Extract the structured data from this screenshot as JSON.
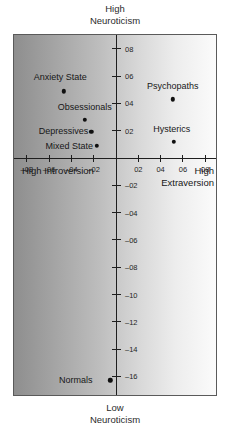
{
  "chart_data": {
    "type": "scatter",
    "title": "",
    "top_caption": [
      "High",
      "Neuroticism"
    ],
    "bottom_caption": [
      "Low",
      "Neuroticism"
    ],
    "xlabel": "",
    "ylabel": "",
    "xlim": [
      -10,
      10
    ],
    "ylim": [
      -18,
      10
    ],
    "grid": false,
    "legend": "none",
    "axis_quadrant_labels": {
      "left": [
        "High",
        "Introversion"
      ],
      "right": [
        "High",
        "Extraversion"
      ]
    },
    "xticks": [
      {
        "value": -8,
        "label": "–08"
      },
      {
        "value": -6,
        "label": "–06"
      },
      {
        "value": -4,
        "label": "–04"
      },
      {
        "value": -2,
        "label": "–02"
      },
      {
        "value": 2,
        "label": "02"
      },
      {
        "value": 4,
        "label": "04"
      },
      {
        "value": 6,
        "label": "06"
      },
      {
        "value": 8,
        "label": "08"
      }
    ],
    "yticks": [
      {
        "value": 8,
        "label": "08"
      },
      {
        "value": 6,
        "label": "06"
      },
      {
        "value": 4,
        "label": "04"
      },
      {
        "value": 2,
        "label": "02"
      },
      {
        "value": -2,
        "label": "–02"
      },
      {
        "value": -4,
        "label": "–04"
      },
      {
        "value": -6,
        "label": "–06"
      },
      {
        "value": -8,
        "label": "–08"
      },
      {
        "value": -10,
        "label": "–10"
      },
      {
        "value": -12,
        "label": "–12"
      },
      {
        "value": -14,
        "label": "–14"
      },
      {
        "value": -16,
        "label": "–16"
      }
    ],
    "points": [
      {
        "name": "Anxiety State",
        "x": -4.7,
        "y": 4.9,
        "label_dx": -0.3,
        "label_dy": 1.0,
        "label_anchor": "center"
      },
      {
        "name": "Obsessionals",
        "x": -2.8,
        "y": 2.8,
        "label_dx": 0.0,
        "label_dy": 0.95,
        "label_anchor": "center"
      },
      {
        "name": "Depressives",
        "x": -2.2,
        "y": 1.9,
        "label_dx": -2.5,
        "label_dy": 0.05,
        "label_anchor": "center"
      },
      {
        "name": "Mixed State",
        "x": -1.7,
        "y": 0.9,
        "label_dx": -2.5,
        "label_dy": 0.0,
        "label_anchor": "center"
      },
      {
        "name": "Psychopaths",
        "x": 5.1,
        "y": 4.3,
        "label_dx": 0.0,
        "label_dy": 0.95,
        "label_anchor": "center"
      },
      {
        "name": "Hysterics",
        "x": 5.2,
        "y": 1.2,
        "label_dx": -0.2,
        "label_dy": 0.95,
        "label_anchor": "center"
      },
      {
        "name": "Normals",
        "x": -0.5,
        "y": -16.3,
        "label_dx": -3.1,
        "label_dy": 0.05,
        "label_anchor": "center"
      }
    ]
  }
}
